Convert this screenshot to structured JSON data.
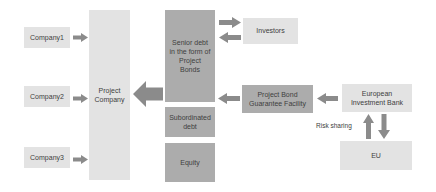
{
  "diagram": {
    "colors": {
      "background": "#ffffff",
      "light_box": "#e3e3e3",
      "dark_box": "#acacac",
      "arrow": "#8b8b8b",
      "text": "#3e3e3e"
    },
    "nodes": {
      "company1": {
        "label": "Company1"
      },
      "company2": {
        "label": "Company2"
      },
      "company3": {
        "label": "Company3"
      },
      "project_company": {
        "label": "Project Company"
      },
      "senior_debt": {
        "label": "Senior debt in the form of Project Bonds"
      },
      "subordinated_debt": {
        "label": "Subordinated debt"
      },
      "equity": {
        "label": "Equity"
      },
      "investors": {
        "label": "Investors"
      },
      "guarantee_facility": {
        "label": "Project Bond Guarantee Facility"
      },
      "eib": {
        "label": "European Investment Bank"
      },
      "eu": {
        "label": "EU"
      }
    },
    "labels": {
      "risk_sharing": "Risk sharing"
    },
    "arrows": [
      {
        "id": "company1-to-project-company",
        "direction": "right"
      },
      {
        "id": "company2-to-project-company",
        "direction": "right"
      },
      {
        "id": "company3-to-project-company",
        "direction": "right"
      },
      {
        "id": "senior-debt-to-investors",
        "direction": "right"
      },
      {
        "id": "investors-to-senior-debt",
        "direction": "left"
      },
      {
        "id": "senior-debt-to-project-company",
        "direction": "left"
      },
      {
        "id": "guarantee-facility-to-senior-debt",
        "direction": "left"
      },
      {
        "id": "eib-to-guarantee-facility",
        "direction": "left"
      },
      {
        "id": "eu-to-eib",
        "direction": "up"
      },
      {
        "id": "eib-to-eu",
        "direction": "down"
      }
    ]
  }
}
